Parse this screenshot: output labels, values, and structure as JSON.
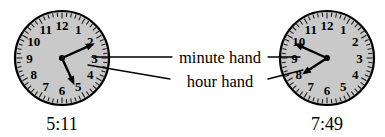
{
  "figure": {
    "background_color": "#ffffff",
    "width": 385,
    "height": 137
  },
  "labels": {
    "minute_hand": "minute hand",
    "hour_hand": "hour hand"
  },
  "style": {
    "face_color": "#c9c9c9",
    "rim_color": "#000000",
    "hand_color": "#000000",
    "numeral_color": "#000000",
    "leader_color": "#000000"
  },
  "numerals": [
    "1",
    "2",
    "3",
    "4",
    "5",
    "6",
    "7",
    "8",
    "9",
    "10",
    "11",
    "12"
  ],
  "clocks": [
    {
      "id": "left",
      "time_label": "5:11",
      "hour": 5,
      "minute": 11,
      "center": {
        "x": 62,
        "y": 58
      },
      "radius": 47,
      "minute_hand_angle_deg": 66,
      "hour_hand_angle_deg": 155.5,
      "minute_hand_length": 36,
      "hour_hand_length": 30
    },
    {
      "id": "right",
      "time_label": "7:49",
      "hour": 7,
      "minute": 49,
      "center": {
        "x": 327,
        "y": 58
      },
      "radius": 47,
      "minute_hand_angle_deg": 294,
      "hour_hand_angle_deg": 236.5,
      "minute_hand_length": 36,
      "hour_hand_length": 30
    }
  ],
  "leader_lines": [
    {
      "name": "minute-left",
      "from": {
        "x": 172,
        "y": 57
      },
      "to": {
        "x": 92,
        "y": 57
      }
    },
    {
      "name": "minute-right",
      "from": {
        "x": 268,
        "y": 57
      },
      "to": {
        "x": 300,
        "y": 57
      }
    },
    {
      "name": "hour-left",
      "from": {
        "x": 170,
        "y": 79
      },
      "to": {
        "x": 88,
        "y": 65
      }
    },
    {
      "name": "hour-right",
      "from": {
        "x": 268,
        "y": 79
      },
      "to": {
        "x": 303,
        "y": 70
      }
    }
  ],
  "label_positions": {
    "minute_hand": {
      "x": 220,
      "y": 57
    },
    "hour_hand": {
      "x": 220,
      "y": 81
    }
  },
  "time_positions": {
    "left": {
      "x": 62,
      "y": 124
    },
    "right": {
      "x": 327,
      "y": 124
    }
  }
}
